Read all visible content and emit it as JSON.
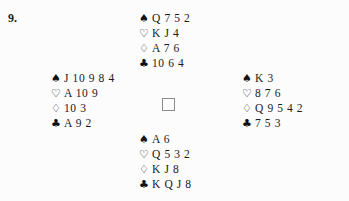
{
  "problem": {
    "number": "9."
  },
  "suits": {
    "spade": "♠",
    "heart": "♡",
    "diamond": "♢",
    "club": "♣"
  },
  "center": {
    "label": ""
  },
  "hands": {
    "north": {
      "position": "North",
      "spades": "Q 7 5 2",
      "hearts": "K J 4",
      "diamonds": "A 7 6",
      "clubs": "10 6 4"
    },
    "west": {
      "position": "West",
      "spades": "J 10 9 8 4",
      "hearts": "A 10 9",
      "diamonds": "10 3",
      "clubs": "A 9 2"
    },
    "east": {
      "position": "East",
      "spades": "K 3",
      "hearts": "8 7 6",
      "diamonds": "Q 9 5 4 2",
      "clubs": "7 5 3"
    },
    "south": {
      "position": "South",
      "spades": "A 6",
      "hearts": "Q 5 3 2",
      "diamonds": "K J 8",
      "clubs": "K Q J 8"
    }
  },
  "colors": {
    "background": "#fcfcfc",
    "text": "#1a1a1a",
    "box_border": "#8c8c8c"
  }
}
